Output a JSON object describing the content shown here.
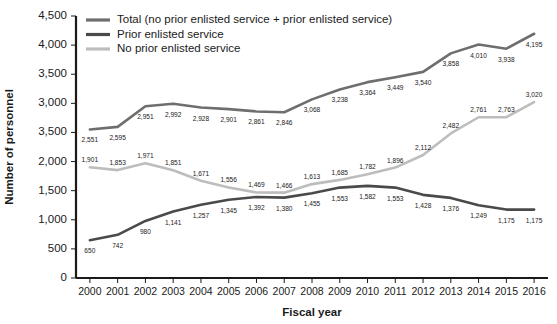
{
  "chart_data": {
    "type": "line",
    "title": "",
    "xlabel": "Fiscal year",
    "ylabel": "Number of personnel",
    "grid": false,
    "legend_position": "top-left",
    "categories": [
      "2000",
      "2001",
      "2002",
      "2003",
      "2004",
      "2005",
      "2006",
      "2007",
      "2008",
      "2009",
      "2010",
      "2011",
      "2012",
      "2013",
      "2014",
      "2015",
      "2016"
    ],
    "x": [
      2000,
      2001,
      2002,
      2003,
      2004,
      2005,
      2006,
      2007,
      2008,
      2009,
      2010,
      2011,
      2012,
      2013,
      2014,
      2015,
      2016
    ],
    "ylim": [
      0,
      4500
    ],
    "ytick_values": [
      4500,
      4000,
      3500,
      3000,
      2500,
      2000,
      1500,
      1000,
      500,
      0
    ],
    "ytick_labels": [
      "4,500",
      "4,000",
      "3,500",
      "3,000",
      "3,500",
      "2,000",
      "1,500",
      "1,000",
      "500",
      "0"
    ],
    "series": [
      {
        "name": "Total (no prior enlisted service + prior enlisted service)",
        "color": "#6e6e6e",
        "values": [
          2551,
          2595,
          2951,
          2992,
          2928,
          2901,
          2861,
          2846,
          3068,
          3238,
          3364,
          3449,
          3540,
          3858,
          4010,
          3938,
          4195
        ],
        "labels": [
          "2,551",
          "2,595",
          "2,951",
          "2,992",
          "2,928",
          "2,901",
          "2,861",
          "2,846",
          "3,068",
          "3,238",
          "3,364",
          "3,449",
          "3,540",
          "3,858",
          "4,010",
          "3,938",
          "4,195"
        ]
      },
      {
        "name": "Prior enlisted service",
        "color": "#4a4a4a",
        "values": [
          650,
          742,
          980,
          1141,
          1257,
          1345,
          1392,
          1380,
          1455,
          1553,
          1582,
          1553,
          1428,
          1376,
          1249,
          1175,
          1175
        ],
        "labels": [
          "650",
          "742",
          "980",
          "1,141",
          "1,257",
          "1,345",
          "1,392",
          "1,380",
          "1,455",
          "1,553",
          "1,582",
          "1,553",
          "1,428",
          "1,376",
          "1,249",
          "1,175",
          "1,175"
        ]
      },
      {
        "name": "No prior enlisted service",
        "color": "#bdbdbd",
        "values": [
          1901,
          1853,
          1971,
          1851,
          1671,
          1556,
          1469,
          1466,
          1613,
          1685,
          1782,
          1896,
          2112,
          2482,
          2761,
          2763,
          3020
        ],
        "labels": [
          "1,901",
          "1,853",
          "1,971",
          "1,851",
          "1,671",
          "1,556",
          "1,469",
          "1,466",
          "1,613",
          "1,685",
          "1,782",
          "1,896",
          "2,112",
          "2,482",
          "2,761",
          "2,763",
          "3,020"
        ]
      }
    ]
  },
  "legend": {
    "entries": [
      {
        "label": "Total (no prior enlisted service + prior enlisted service)",
        "color": "#6e6e6e"
      },
      {
        "label": "Prior enlisted service",
        "color": "#4a4a4a"
      },
      {
        "label": "No prior enlisted service",
        "color": "#bdbdbd"
      }
    ]
  }
}
